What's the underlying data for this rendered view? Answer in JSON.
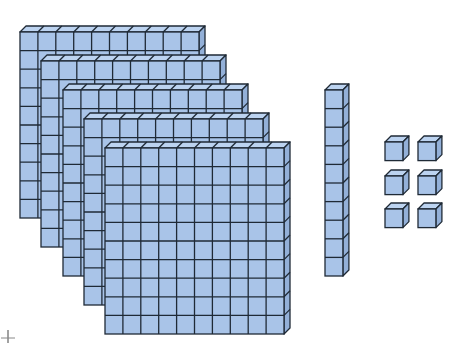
{
  "diagram": {
    "colors": {
      "background": "#ffffff",
      "cube_face": "#a9c4e8",
      "cube_top": "#bcd3f0",
      "cube_side": "#93b0d8",
      "line": "#1f2a36"
    },
    "cube_size": {
      "w": 17.9,
      "h": 18.6,
      "depth": 6
    },
    "flats": [
      {
        "name": "hundreds-flat-1",
        "x": 20,
        "y": 32,
        "cols": 10,
        "rows": 10
      },
      {
        "name": "hundreds-flat-2",
        "x": 41,
        "y": 61,
        "cols": 10,
        "rows": 10
      },
      {
        "name": "hundreds-flat-3",
        "x": 63,
        "y": 90,
        "cols": 10,
        "rows": 10
      },
      {
        "name": "hundreds-flat-4",
        "x": 84,
        "y": 119,
        "cols": 10,
        "rows": 10
      },
      {
        "name": "hundreds-flat-5",
        "x": 105,
        "y": 148,
        "cols": 10,
        "rows": 10
      }
    ],
    "rods": [
      {
        "name": "tens-rod-1",
        "x": 325,
        "y": 90,
        "cols": 1,
        "rows": 10
      }
    ],
    "units": [
      {
        "name": "unit-cube-1",
        "x": 385,
        "y": 142
      },
      {
        "name": "unit-cube-2",
        "x": 418,
        "y": 142
      },
      {
        "name": "unit-cube-3",
        "x": 385,
        "y": 176
      },
      {
        "name": "unit-cube-4",
        "x": 418,
        "y": 176
      },
      {
        "name": "unit-cube-5",
        "x": 385,
        "y": 209
      },
      {
        "name": "unit-cube-6",
        "x": 418,
        "y": 209
      }
    ],
    "counts": {
      "hundreds": 5,
      "tens": 1,
      "ones": 6,
      "value": 516
    },
    "cursor": {
      "x": 8,
      "y": 338
    }
  }
}
